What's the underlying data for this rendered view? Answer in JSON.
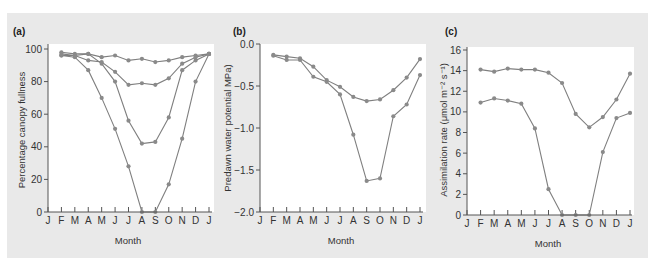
{
  "figure": {
    "background": "#e9e9e9",
    "series_color": "#808080"
  },
  "chart_data": [
    {
      "type": "line",
      "panel_label": "(a)",
      "title": "",
      "xlabel": "Month",
      "ylabel": "Percentage canopy fullness",
      "categories": [
        "J",
        "F",
        "M",
        "A",
        "M",
        "J",
        "J",
        "A",
        "S",
        "O",
        "N",
        "D",
        "J"
      ],
      "ylim": [
        0,
        100
      ],
      "yticks": [
        0,
        20,
        40,
        60,
        80,
        100
      ],
      "ytick_labels": [
        "0",
        "20",
        "40",
        "60",
        "80",
        "100"
      ],
      "grid": false,
      "series": [
        {
          "name": "Series 1",
          "start_index": 1,
          "values": [
            98,
            97,
            97,
            95,
            96,
            93,
            94,
            92,
            93,
            95,
            96,
            97
          ]
        },
        {
          "name": "Series 2",
          "start_index": 1,
          "values": [
            97,
            96,
            93,
            92,
            86,
            78,
            79,
            78,
            82,
            91,
            95,
            97
          ]
        },
        {
          "name": "Series 3",
          "start_index": 1,
          "values": [
            96,
            96,
            97,
            91,
            80,
            56,
            42,
            43,
            58,
            87,
            93,
            97
          ]
        },
        {
          "name": "Series 4",
          "start_index": 1,
          "values": [
            96,
            95,
            87,
            70,
            51,
            28,
            0,
            0,
            17,
            45,
            80,
            97
          ]
        }
      ]
    },
    {
      "type": "line",
      "panel_label": "(b)",
      "title": "",
      "xlabel": "Month",
      "ylabel": "Predawn water potential MPa)",
      "categories": [
        "J",
        "F",
        "M",
        "A",
        "M",
        "J",
        "J",
        "A",
        "S",
        "O",
        "N",
        "D",
        "J"
      ],
      "ylim": [
        -2.0,
        0.0
      ],
      "yticks": [
        0.0,
        -0.5,
        -1.0,
        -1.5,
        -2.0
      ],
      "ytick_labels": [
        "0.0",
        "−0.5",
        "−1.0",
        "−1.5",
        "−2.0"
      ],
      "grid": false,
      "series": [
        {
          "name": "Series 1",
          "start_index": 1,
          "values": [
            -0.13,
            -0.15,
            -0.17,
            -0.27,
            -0.43,
            -0.51,
            -0.63,
            -0.68,
            -0.66,
            -0.55,
            -0.4,
            -0.18
          ]
        },
        {
          "name": "Series 2",
          "start_index": 1,
          "values": [
            -0.14,
            -0.19,
            -0.19,
            -0.39,
            -0.45,
            -0.6,
            -1.08,
            -1.63,
            -1.6,
            -0.86,
            -0.72,
            -0.37
          ]
        }
      ]
    },
    {
      "type": "line",
      "panel_label": "(c)",
      "title": "",
      "xlabel": "Month",
      "ylabel": "Assimilation rate (μmol m⁻² s⁻¹)",
      "categories": [
        "J",
        "F",
        "M",
        "A",
        "M",
        "J",
        "J",
        "A",
        "S",
        "O",
        "N",
        "D",
        "J"
      ],
      "ylim": [
        0,
        16
      ],
      "yticks": [
        0,
        2,
        4,
        6,
        8,
        10,
        12,
        14,
        16
      ],
      "ytick_labels": [
        "0",
        "2",
        "4",
        "6",
        "8",
        "10",
        "12",
        "14",
        "16"
      ],
      "grid": false,
      "series": [
        {
          "name": "Series 1",
          "start_index": 1,
          "values": [
            14.1,
            13.9,
            14.2,
            14.1,
            14.1,
            13.8,
            12.8,
            9.8,
            8.5,
            9.5,
            11.2,
            13.7
          ]
        },
        {
          "name": "Series 2",
          "start_index": 1,
          "values": [
            10.9,
            11.3,
            11.1,
            10.8,
            8.4,
            2.5,
            0,
            0,
            0,
            6.1,
            9.4,
            9.9
          ]
        }
      ]
    }
  ]
}
